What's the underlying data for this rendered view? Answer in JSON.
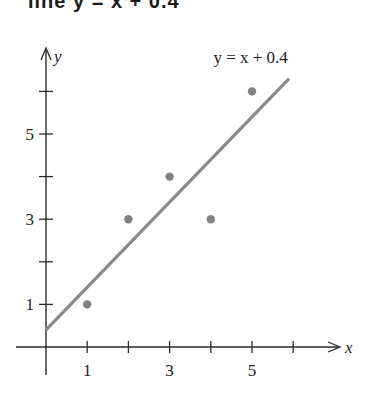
{
  "caption": "line y = x + 0.4",
  "chart_data": {
    "type": "scatter",
    "title": "",
    "xlabel": "x",
    "ylabel": "y",
    "xlim": [
      0,
      6.5
    ],
    "ylim": [
      0,
      7
    ],
    "x_ticks": [
      1,
      2,
      3,
      4,
      5,
      6
    ],
    "x_tick_labels": [
      "1",
      "",
      "3",
      "",
      "5",
      ""
    ],
    "y_ticks": [
      1,
      2,
      3,
      4,
      5,
      6
    ],
    "y_tick_labels": [
      "1",
      "",
      "3",
      "",
      "5",
      ""
    ],
    "grid": false,
    "series": [
      {
        "name": "data points",
        "type": "scatter",
        "x": [
          1,
          2,
          3,
          4,
          5
        ],
        "y": [
          1,
          3,
          4,
          3,
          6
        ],
        "color": "#808080"
      },
      {
        "name": "y = x + 0.4",
        "type": "line",
        "slope": 1,
        "intercept": 0.4,
        "x_range": [
          0,
          5.9
        ],
        "color": "#8a8a8a"
      }
    ],
    "annotations": [
      {
        "text": "y = x + 0.4",
        "x": 4.7,
        "y": 6.9
      }
    ]
  }
}
